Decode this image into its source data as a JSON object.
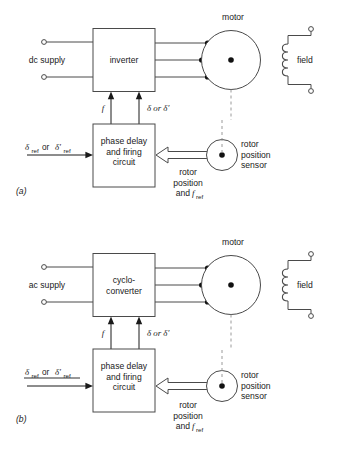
{
  "figure": {
    "background": "#ffffff",
    "line_color": "#4a4a4a",
    "text_color": "#1a1a1a",
    "dash_color": "#9a9a9a"
  },
  "panels": [
    {
      "id": "a",
      "caption": "(a)",
      "supply_label": "dc supply",
      "converter_label_lines": [
        "inverter"
      ],
      "control_label_lines": [
        "phase delay",
        "and firing",
        "circuit"
      ],
      "motor_label": "motor",
      "field_label": "field",
      "sensor_label_lines": [
        "rotor",
        "position",
        "sensor"
      ],
      "feedback_label_lines": [
        "rotor",
        "position",
        "and"
      ],
      "feedback_sym": "f",
      "feedback_sub": "ref",
      "freq_symbol": "f",
      "delta_symbol": "δ or δ′",
      "ref_input": {
        "first_sym": "δ",
        "first_sub": "ref",
        "connector": "or",
        "second_sym": "δ′",
        "second_sub": "ref"
      }
    },
    {
      "id": "b",
      "caption": "(b)",
      "supply_label": "ac supply",
      "converter_label_lines": [
        "cyclo-",
        "converter"
      ],
      "control_label_lines": [
        "phase delay",
        "and firing",
        "circuit"
      ],
      "motor_label": "motor",
      "field_label": "field",
      "sensor_label_lines": [
        "rotor",
        "position",
        "sensor"
      ],
      "feedback_label_lines": [
        "rotor",
        "position",
        "and"
      ],
      "feedback_sym": "f",
      "feedback_sub": "ref",
      "freq_symbol": "f",
      "delta_symbol": "δ or δ′",
      "ref_input": {
        "first_sym": "δ",
        "first_sub": "ref",
        "connector": "or",
        "second_sym": "δ′",
        "second_sub": "ref"
      }
    }
  ]
}
